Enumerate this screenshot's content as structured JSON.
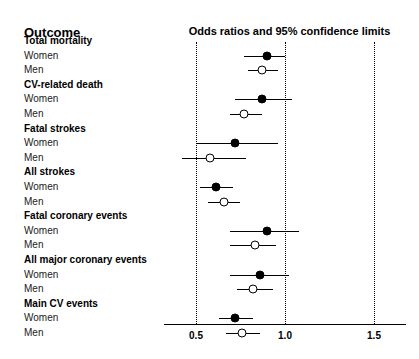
{
  "header": {
    "outcome_label": "Outcome",
    "plot_title": "Odds ratios and 95% confidence limits"
  },
  "axis": {
    "ticks": [
      {
        "label": "0.5",
        "value": 0.5
      },
      {
        "label": "1.0",
        "value": 1.0
      },
      {
        "label": "1.5",
        "value": 1.5
      }
    ],
    "min": 0.48,
    "max": 1.56,
    "gridlines": [
      0.5,
      1.0,
      1.5
    ]
  },
  "rows": [
    {
      "label": "Total mortality",
      "type": "group"
    },
    {
      "label": "Women",
      "type": "data",
      "marker": "filled"
    },
    {
      "label": "Men",
      "type": "data",
      "marker": "open"
    },
    {
      "label": "CV-related death",
      "type": "group"
    },
    {
      "label": "Women",
      "type": "data",
      "marker": "filled"
    },
    {
      "label": "Men",
      "type": "data",
      "marker": "open"
    },
    {
      "label": "Fatal strokes",
      "type": "group"
    },
    {
      "label": "Women",
      "type": "data",
      "marker": "filled"
    },
    {
      "label": "Men",
      "type": "data",
      "marker": "open"
    },
    {
      "label": "All strokes",
      "type": "group"
    },
    {
      "label": "Women",
      "type": "data",
      "marker": "filled"
    },
    {
      "label": "Men",
      "type": "data",
      "marker": "open"
    },
    {
      "label": "Fatal coronary events",
      "type": "group"
    },
    {
      "label": "Women",
      "type": "data",
      "marker": "filled"
    },
    {
      "label": "Men",
      "type": "data",
      "marker": "open"
    },
    {
      "label": "All major coronary events",
      "type": "group"
    },
    {
      "label": "Women",
      "type": "data",
      "marker": "filled"
    },
    {
      "label": "Men",
      "type": "data",
      "marker": "open"
    },
    {
      "label": "Main CV events",
      "type": "group"
    },
    {
      "label": "Women",
      "type": "data",
      "marker": "filled"
    },
    {
      "label": "Men",
      "type": "data",
      "marker": "open"
    }
  ],
  "chart_data": {
    "type": "scatter",
    "subtype": "forest-plot",
    "title": "Odds ratios and 95% confidence limits",
    "xlabel": "",
    "ylabel": "Outcome",
    "xlim": [
      0.48,
      1.56
    ],
    "xticks": [
      0.5,
      1.0,
      1.5
    ],
    "xticklabels": [
      "0.5",
      "1.0",
      "1.5"
    ],
    "grid": "vertical-dotted",
    "legend": "none",
    "reference_line": 1.0,
    "groups": [
      {
        "outcome": "Total mortality",
        "estimates": [
          {
            "stratum": "Women",
            "marker": "filled",
            "or": 0.9,
            "ci_low": 0.77,
            "ci_high": 1.0
          },
          {
            "stratum": "Men",
            "marker": "open",
            "or": 0.87,
            "ci_low": 0.79,
            "ci_high": 0.96
          }
        ]
      },
      {
        "outcome": "CV-related death",
        "estimates": [
          {
            "stratum": "Women",
            "marker": "filled",
            "or": 0.87,
            "ci_low": 0.72,
            "ci_high": 1.04
          },
          {
            "stratum": "Men",
            "marker": "open",
            "or": 0.77,
            "ci_low": 0.69,
            "ci_high": 0.87
          }
        ]
      },
      {
        "outcome": "Fatal strokes",
        "estimates": [
          {
            "stratum": "Women",
            "marker": "filled",
            "or": 0.72,
            "ci_low": 0.5,
            "ci_high": 0.96
          },
          {
            "stratum": "Men",
            "marker": "open",
            "or": 0.58,
            "ci_low": 0.42,
            "ci_high": 0.78
          }
        ]
      },
      {
        "outcome": "All strokes",
        "estimates": [
          {
            "stratum": "Women",
            "marker": "filled",
            "or": 0.61,
            "ci_low": 0.52,
            "ci_high": 0.71
          },
          {
            "stratum": "Men",
            "marker": "open",
            "or": 0.66,
            "ci_low": 0.57,
            "ci_high": 0.75
          }
        ]
      },
      {
        "outcome": "Fatal coronary events",
        "estimates": [
          {
            "stratum": "Women",
            "marker": "filled",
            "or": 0.9,
            "ci_low": 0.69,
            "ci_high": 1.08
          },
          {
            "stratum": "Men",
            "marker": "open",
            "or": 0.83,
            "ci_low": 0.69,
            "ci_high": 0.95
          }
        ]
      },
      {
        "outcome": "All major coronary events",
        "estimates": [
          {
            "stratum": "Women",
            "marker": "filled",
            "or": 0.86,
            "ci_low": 0.69,
            "ci_high": 1.02
          },
          {
            "stratum": "Men",
            "marker": "open",
            "or": 0.82,
            "ci_low": 0.73,
            "ci_high": 0.93
          }
        ]
      },
      {
        "outcome": "Main CV events",
        "estimates": [
          {
            "stratum": "Women",
            "marker": "filled",
            "or": 0.72,
            "ci_low": 0.63,
            "ci_high": 0.82
          },
          {
            "stratum": "Men",
            "marker": "open",
            "or": 0.76,
            "ci_low": 0.67,
            "ci_high": 0.86
          }
        ]
      }
    ]
  },
  "layout": {
    "row_start_y": 41,
    "row_step": 14.6,
    "plot_left_px": 160,
    "plot_width_px": 259,
    "x_at_0_5": 36,
    "x_at_1_5": 214
  }
}
